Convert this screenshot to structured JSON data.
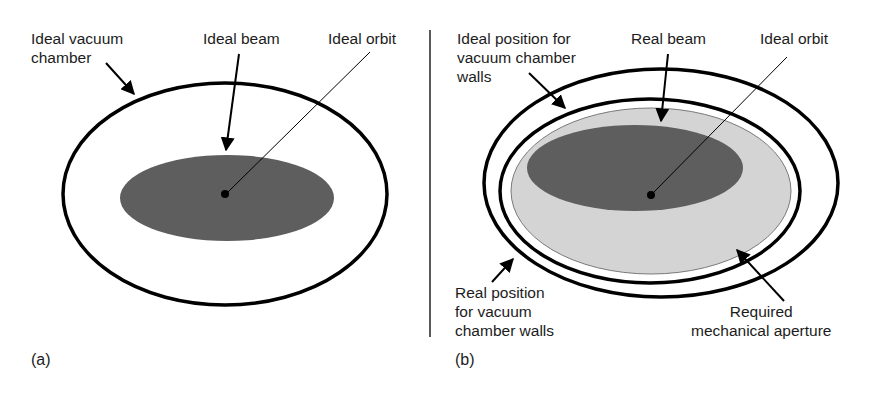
{
  "panels": [
    {
      "tag": "(a)",
      "labels": {
        "chamber": "Ideal vacuum\nchamber",
        "beam": "Ideal beam",
        "orbit": "Ideal orbit"
      }
    },
    {
      "tag": "(b)",
      "labels": {
        "ideal_walls": "Ideal position for\nvacuum chamber\nwalls",
        "beam": "Real beam",
        "orbit": "Ideal orbit",
        "real_walls": "Real position\nfor vacuum\nchamber walls",
        "aperture": "Required\nmechanical aperture"
      }
    }
  ],
  "colors": {
    "beam": "#5e5e5e",
    "aperture": "#d4d4d4",
    "line": "#000000"
  }
}
